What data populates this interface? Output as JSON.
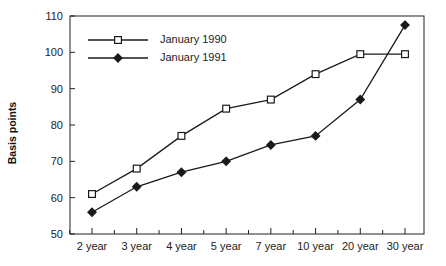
{
  "chart_data": {
    "type": "line",
    "title": "",
    "xlabel": "",
    "ylabel": "Basis points",
    "categories": [
      "2 year",
      "3 year",
      "4 year",
      "5 year",
      "7 year",
      "10 year",
      "20 year",
      "30 year"
    ],
    "ylim": [
      50,
      110
    ],
    "yticks": [
      50,
      60,
      70,
      80,
      90,
      100,
      110
    ],
    "ytick_labels": [
      "50",
      "60",
      "70",
      "80",
      "90",
      "100",
      "110"
    ],
    "grid": false,
    "legend_position": "top-left inside",
    "series": [
      {
        "name": "January 1990",
        "marker": "open-square",
        "values": [
          61,
          68,
          77,
          84.5,
          87,
          94,
          99.5,
          99.5
        ]
      },
      {
        "name": "January 1991",
        "marker": "filled-diamond",
        "values": [
          56,
          63,
          67,
          70,
          74.5,
          77,
          87,
          107.5
        ]
      }
    ],
    "colors": {
      "line": "#1a1a1a",
      "marker_fill_open": "#ffffff",
      "marker_fill_closed": "#1a1a1a",
      "axis": "#222222",
      "background": "#ffffff"
    }
  },
  "legend": {
    "entries": [
      {
        "label": "January 1990"
      },
      {
        "label": "January 1991"
      }
    ]
  }
}
